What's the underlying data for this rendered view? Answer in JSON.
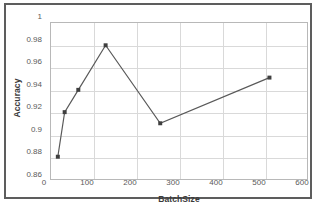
{
  "chart_data": {
    "type": "line",
    "title": "",
    "xlabel": "BatchSize",
    "ylabel": "Accuracy",
    "xlim": [
      0,
      600
    ],
    "ylim": [
      0.86,
      1
    ],
    "grid": true,
    "legend": "none",
    "x": [
      16,
      32,
      64,
      128,
      256,
      512
    ],
    "values": [
      0.88,
      0.92,
      0.94,
      0.98,
      0.91,
      0.951
    ],
    "series": [
      {
        "name": "Accuracy",
        "x": [
          16,
          32,
          64,
          128,
          256,
          512
        ],
        "values": [
          0.88,
          0.92,
          0.94,
          0.98,
          0.91,
          0.951
        ],
        "line_color": "#595959",
        "marker_color": "#3f3f3f",
        "marker": "square"
      }
    ],
    "xticks": [
      0,
      100,
      200,
      300,
      400,
      500,
      600
    ],
    "xtick_labels": [
      "0",
      "100",
      "200",
      "300",
      "400",
      "500",
      "600"
    ],
    "yticks": [
      0.86,
      0.88,
      0.9,
      0.92,
      0.94,
      0.96,
      0.98,
      1
    ],
    "ytick_labels": [
      "0.86",
      "0.88",
      "0.9",
      "0.92",
      "0.94",
      "0.96",
      "0.98",
      "1"
    ]
  },
  "style": {
    "grid_color": "#d9d9d9",
    "axis_color": "#b8b8b8",
    "frame_color": "#5d5d5d",
    "tick_text_color": "#5a5a5a",
    "title_text_color": "#3b3b3b",
    "background": "#ffffff"
  }
}
